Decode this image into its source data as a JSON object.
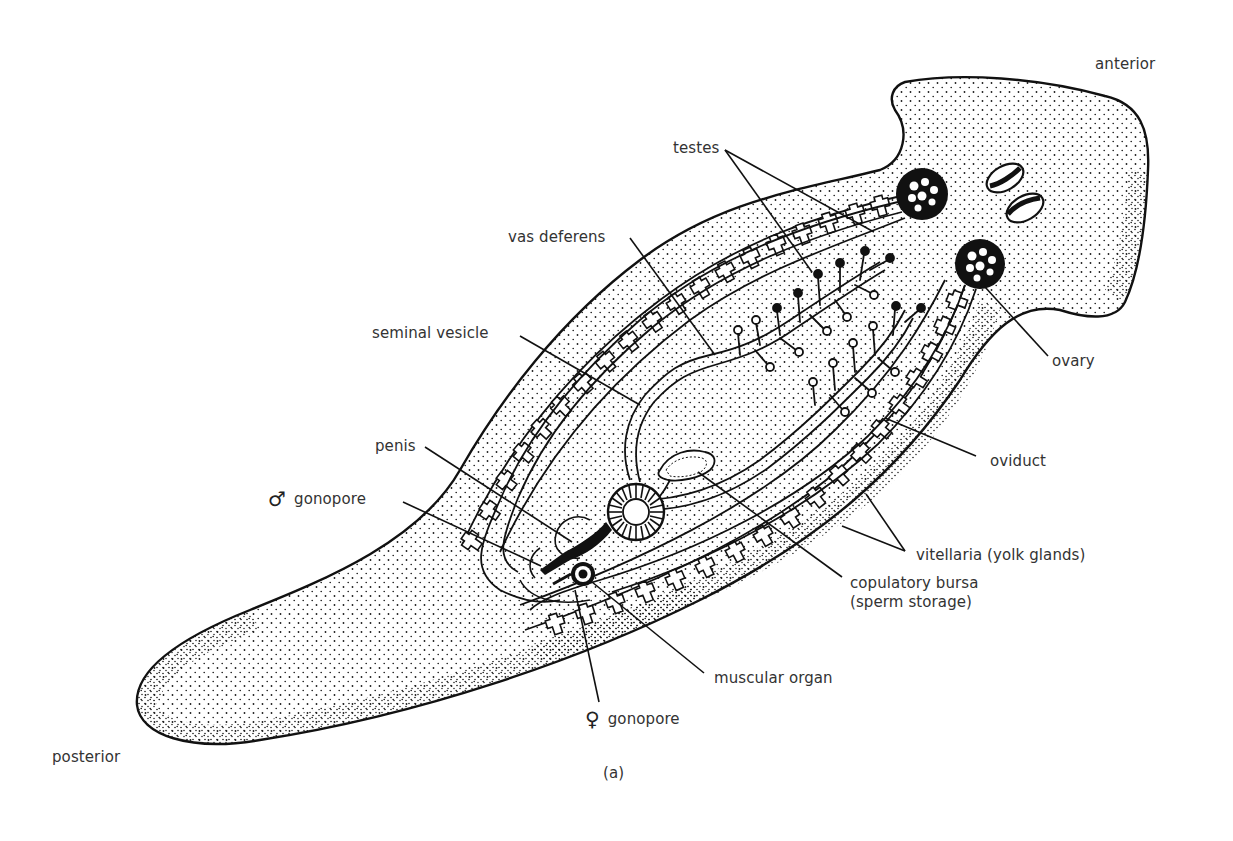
{
  "figure": {
    "caption": "(a)",
    "colors": {
      "ink": "#111111",
      "stipple": "#1a1a1a",
      "paper": "#ffffff",
      "label_text": "#333333"
    }
  },
  "orientation": {
    "anterior": "anterior",
    "posterior": "posterior"
  },
  "labels": {
    "testes": "testes",
    "vas_deferens": "vas deferens",
    "seminal_vesicle": "seminal vesicle",
    "penis": "penis",
    "male_gonopore": {
      "symbol": "♂",
      "text": "gonopore"
    },
    "ovary": "ovary",
    "oviduct": "oviduct",
    "vitellaria": "vitellaria (yolk glands)",
    "copulatory_bursa": {
      "line1": "copulatory bursa",
      "line2": "(sperm storage)"
    },
    "muscular_organ": "muscular organ",
    "female_gonopore": {
      "symbol": "♀",
      "text": "gonopore"
    }
  }
}
